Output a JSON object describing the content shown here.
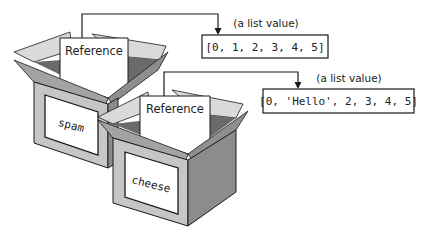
{
  "diagram": {
    "type": "variables-as-boxes-with-references",
    "colors": {
      "line": "#1a1a1a",
      "front_face": "#c6c6c6",
      "side_face": "#8c8c8c",
      "back_flap": "#dadada",
      "front_flap": "#a3a3a3",
      "inner_dark": "#555555",
      "card": "#ffffff"
    },
    "boxes": [
      {
        "variable_name": "spam",
        "card_label": "Reference",
        "points_to": 0
      },
      {
        "variable_name": "cheese",
        "card_label": "Reference",
        "points_to": 1
      }
    ],
    "list_values": [
      {
        "caption": "(a list value)",
        "text": "[0, 1, 2, 3, 4, 5]"
      },
      {
        "caption": "(a list value)",
        "text": "[0, 'Hello', 2, 3, 4, 5]"
      }
    ]
  }
}
